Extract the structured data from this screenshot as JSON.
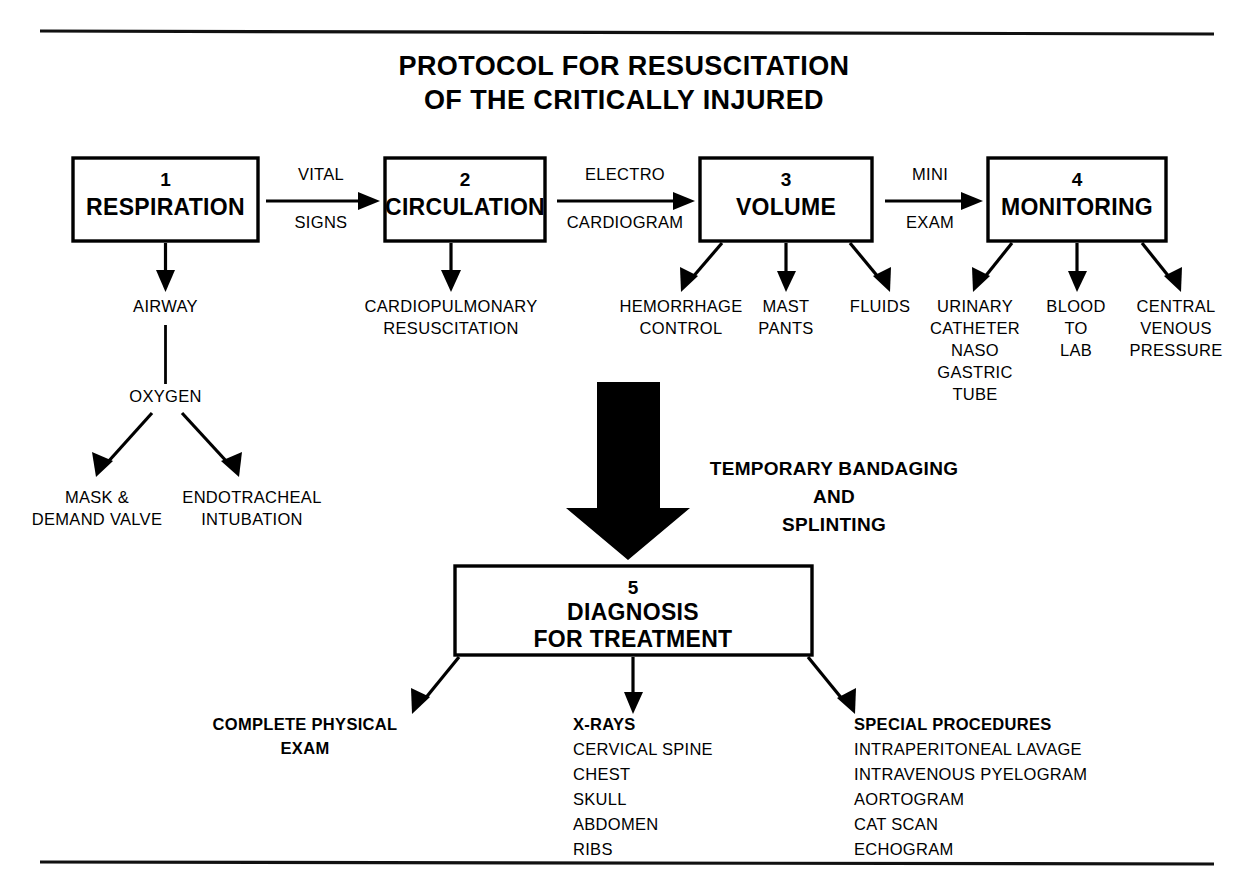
{
  "title": {
    "line1": "PROTOCOL FOR RESUSCITATION",
    "line2": "OF THE CRITICALLY INJURED"
  },
  "stages": [
    {
      "number": "1",
      "label": "RESPIRATION"
    },
    {
      "number": "2",
      "label": "CIRCULATION"
    },
    {
      "number": "3",
      "label": "VOLUME"
    },
    {
      "number": "4",
      "label": "MONITORING"
    }
  ],
  "transitions": [
    {
      "top": "VITAL",
      "bottom": "SIGNS"
    },
    {
      "top": "ELECTRO",
      "bottom": "CARDIOGRAM"
    },
    {
      "top": "MINI",
      "bottom": "EXAM"
    }
  ],
  "branch_respiration": {
    "airway": "AIRWAY",
    "oxygen": "OXYGEN",
    "left": {
      "line1": "MASK &",
      "line2": "DEMAND VALVE"
    },
    "right": {
      "line1": "ENDOTRACHEAL",
      "line2": "INTUBATION"
    }
  },
  "branch_circulation": {
    "line1": "CARDIOPULMONARY",
    "line2": "RESUSCITATION"
  },
  "branch_volume": [
    {
      "line1": "HEMORRHAGE",
      "line2": "CONTROL"
    },
    {
      "line1": "MAST",
      "line2": "PANTS"
    },
    {
      "line1": "FLUIDS",
      "line2": ""
    }
  ],
  "branch_monitoring": [
    {
      "line1": "URINARY",
      "line2": "CATHETER",
      "line3": "NASO",
      "line4": "GASTRIC",
      "line5": "TUBE"
    },
    {
      "line1": "BLOOD",
      "line2": "TO",
      "line3": "LAB",
      "line4": "",
      "line5": ""
    },
    {
      "line1": "CENTRAL",
      "line2": "VENOUS",
      "line3": "PRESSURE",
      "line4": "",
      "line5": ""
    }
  ],
  "interim_step": {
    "line1": "TEMPORARY BANDAGING",
    "line2": "AND",
    "line3": "SPLINTING"
  },
  "diagnosis_box": {
    "number": "5",
    "line1": "DIAGNOSIS",
    "line2": "FOR TREATMENT"
  },
  "diagnosis_columns": [
    {
      "heading_line1": "COMPLETE PHYSICAL",
      "heading_line2": "EXAM",
      "items": []
    },
    {
      "heading_line1": "X-RAYS",
      "heading_line2": "",
      "items": [
        "CERVICAL SPINE",
        "CHEST",
        "SKULL",
        "ABDOMEN",
        "RIBS"
      ]
    },
    {
      "heading_line1": "SPECIAL PROCEDURES",
      "heading_line2": "",
      "items": [
        "INTRAPERITONEAL LAVAGE",
        "INTRAVENOUS PYELOGRAM",
        "AORTOGRAM",
        "CAT SCAN",
        "ECHOGRAM"
      ]
    }
  ],
  "colors": {
    "ink": "#000000",
    "paper": "#ffffff"
  }
}
